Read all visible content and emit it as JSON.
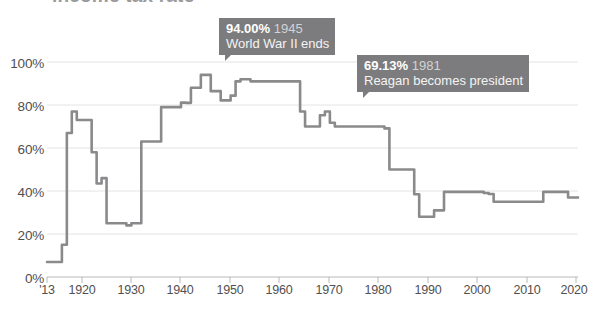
{
  "chart_data": {
    "type": "line",
    "title": "",
    "xlabel": "",
    "ylabel": "",
    "ylim": [
      0,
      100
    ],
    "xlim": [
      1913,
      2020
    ],
    "grid": true,
    "legend_position": "none",
    "y_ticks": [
      "0%",
      "20%",
      "40%",
      "60%",
      "80%",
      "100%"
    ],
    "y_tick_values": [
      0,
      20,
      40,
      60,
      80,
      100
    ],
    "x_ticks": [
      "'13",
      "1920",
      "1930",
      "1940",
      "1950",
      "1960",
      "1970",
      "1980",
      "1990",
      "2000",
      "2010",
      "2020"
    ],
    "x_tick_values": [
      1913,
      1920,
      1930,
      1940,
      1950,
      1960,
      1970,
      1980,
      1990,
      2000,
      2010,
      2020
    ],
    "series": [
      {
        "name": "Top marginal income tax rate",
        "color": "#8a8a8c",
        "x": [
          1913,
          1914,
          1915,
          1916,
          1917,
          1918,
          1919,
          1920,
          1921,
          1922,
          1923,
          1924,
          1925,
          1926,
          1927,
          1928,
          1929,
          1930,
          1931,
          1932,
          1933,
          1934,
          1935,
          1936,
          1937,
          1938,
          1939,
          1940,
          1941,
          1942,
          1943,
          1944,
          1945,
          1946,
          1947,
          1948,
          1949,
          1950,
          1951,
          1952,
          1953,
          1954,
          1955,
          1956,
          1957,
          1958,
          1959,
          1960,
          1961,
          1962,
          1963,
          1964,
          1965,
          1966,
          1967,
          1968,
          1969,
          1970,
          1971,
          1972,
          1973,
          1974,
          1975,
          1976,
          1977,
          1978,
          1979,
          1980,
          1981,
          1982,
          1983,
          1984,
          1985,
          1986,
          1987,
          1988,
          1989,
          1990,
          1991,
          1992,
          1993,
          1994,
          1995,
          1996,
          1997,
          1998,
          1999,
          2000,
          2001,
          2002,
          2003,
          2004,
          2005,
          2006,
          2007,
          2008,
          2009,
          2010,
          2011,
          2012,
          2013,
          2014,
          2015,
          2016,
          2017,
          2018,
          2019,
          2020
        ],
        "values": [
          7,
          7,
          7,
          15,
          67,
          77,
          73,
          73,
          73,
          58,
          43.5,
          46,
          25,
          25,
          25,
          25,
          24,
          25,
          25,
          63,
          63,
          63,
          63,
          79,
          79,
          79,
          79,
          81.1,
          81,
          88,
          88,
          94,
          94,
          86.45,
          86.45,
          82.13,
          82.13,
          84.36,
          91,
          92,
          92,
          91,
          91,
          91,
          91,
          91,
          91,
          91,
          91,
          91,
          91,
          77,
          70,
          70,
          70,
          75.25,
          77,
          71.75,
          70,
          70,
          70,
          70,
          70,
          70,
          70,
          70,
          70,
          70,
          69.125,
          50,
          50,
          50,
          50,
          50,
          38.5,
          28,
          28,
          28,
          31,
          31,
          39.6,
          39.6,
          39.6,
          39.6,
          39.6,
          39.6,
          39.6,
          39.6,
          39.1,
          38.6,
          35,
          35,
          35,
          35,
          35,
          35,
          35,
          35,
          35,
          35,
          39.6,
          39.6,
          39.6,
          39.6,
          39.6,
          37,
          37,
          37
        ]
      }
    ],
    "annotations": [
      {
        "value": "94.00%",
        "year": "1945",
        "description": "World War II ends",
        "point_x": 1945,
        "point_y": 94
      },
      {
        "value": "69.13%",
        "year": "1981",
        "description": "Reagan becomes president",
        "point_x": 1981,
        "point_y": 69.13
      }
    ],
    "colors": {
      "line": "#8a8a8c",
      "grid": "#e2e2e2",
      "axis": "#b6b6b8",
      "tooltip_bg": "#7c7c7e",
      "tooltip_text": "#ffffff",
      "tick_text": "#4f4f51"
    },
    "cropped_title_remnant": "income tax rate"
  }
}
